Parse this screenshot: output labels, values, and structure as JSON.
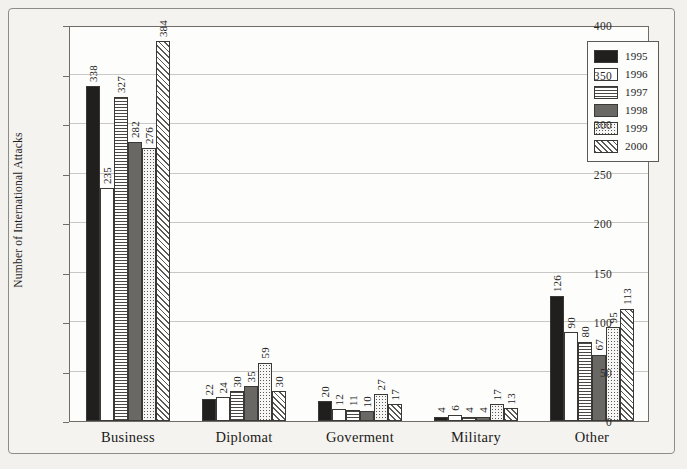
{
  "chart_data": {
    "type": "bar",
    "title": "",
    "xlabel": "",
    "ylabel": "Number of International Attacks",
    "ylim": [
      0,
      400
    ],
    "ytick_labels": [
      "0",
      "50",
      "100",
      "150",
      "200",
      "250",
      "300",
      "350",
      "400"
    ],
    "ytick_values": [
      0,
      50,
      100,
      150,
      200,
      250,
      300,
      350,
      400
    ],
    "grid": true,
    "legend_position": "top-right",
    "categories": [
      "Business",
      "Diplomat",
      "Goverment",
      "Military",
      "Other"
    ],
    "series": [
      {
        "name": "1995",
        "fill": "solid-black",
        "values": [
          338,
          22,
          20,
          4,
          126
        ]
      },
      {
        "name": "1996",
        "fill": "white",
        "values": [
          235,
          24,
          12,
          6,
          90
        ]
      },
      {
        "name": "1997",
        "fill": "horizontal-lines",
        "values": [
          327,
          30,
          11,
          4,
          80
        ]
      },
      {
        "name": "1998",
        "fill": "solid-gray",
        "values": [
          282,
          35,
          10,
          4,
          67
        ]
      },
      {
        "name": "1999",
        "fill": "stipple-dots",
        "values": [
          276,
          59,
          27,
          17,
          95
        ]
      },
      {
        "name": "2000",
        "fill": "diagonal-hatch",
        "values": [
          384,
          30,
          17,
          13,
          113
        ]
      }
    ],
    "colors": {
      "1995": "#211f1d",
      "1996": "#ffffff",
      "1997": "#ffffff",
      "1998": "#6a6864",
      "1999": "#f6f6f4",
      "2000": "#ffffff",
      "axis": "#6f6d69",
      "grid": "#c9c8c4",
      "text": "#1b1a18",
      "background": "#f2f1ee",
      "plot_background": "#fdfdfc"
    }
  }
}
